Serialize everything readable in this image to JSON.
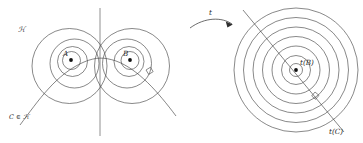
{
  "figure": {
    "colors": {
      "stroke": "#3f3f3f",
      "label": "#2b2b2b",
      "point": "#111111",
      "background": "#ffffff"
    }
  },
  "labels": {
    "family_script_a": "ℋ",
    "point_a": "A",
    "point_b": "B",
    "curve_c": "C ∈ ℋ",
    "map_t": "t",
    "image_point_b": "t(B)",
    "image_curve_c": "t(C)"
  },
  "left_panel": {
    "name": "source-plane",
    "axis": {
      "type": "vertical-line",
      "x": 100,
      "y1": 8,
      "y2": 136
    },
    "point_a": {
      "cx": 71,
      "cy": 60,
      "r": 1.9
    },
    "point_b": {
      "cx": 130,
      "cy": 60,
      "r": 1.9
    },
    "circles_a": [
      {
        "cx": 69.5,
        "cy": 66,
        "r": 37.5
      },
      {
        "cx": 74.5,
        "cy": 63.5,
        "r": 24.5
      },
      {
        "cx": 72.5,
        "cy": 61.5,
        "r": 15.0
      },
      {
        "cx": 71.5,
        "cy": 60.5,
        "r": 9.0
      }
    ],
    "circles_b": [
      {
        "cx": 132.0,
        "cy": 66,
        "r": 37.5
      },
      {
        "cx": 127.0,
        "cy": 63.5,
        "r": 24.5
      },
      {
        "cx": 129.0,
        "cy": 61.5,
        "r": 15.0
      },
      {
        "cx": 130.0,
        "cy": 60.5,
        "r": 9.0
      }
    ],
    "curve_c_path": "M 20 125 C 38 101, 56 74, 84 62 C 96 57, 104 57, 116 61 C 138 69, 158 92, 176 116",
    "right_angle_marker": {
      "x": 146,
      "y": 70,
      "size": 5.2,
      "rotate": -32
    }
  },
  "arrow": {
    "name": "transformation-arrow",
    "path": "M 190 28 C 205 17, 222 17, 232 24",
    "head": "M 232 24 L 226.5 22.0 L 228.0 27.4 Z",
    "label_x": 211,
    "label_y": 15
  },
  "right_panel": {
    "name": "image-plane",
    "center": {
      "cx": 296,
      "cy": 70,
      "r": 1.9
    },
    "concentric_circles": [
      {
        "r": 62.0
      },
      {
        "r": 52.5
      },
      {
        "r": 43.0
      },
      {
        "r": 33.5
      },
      {
        "r": 24.0
      },
      {
        "r": 14.5
      },
      {
        "r": 6.5
      }
    ],
    "line_t_c": {
      "x1": 243,
      "y1": 10,
      "x2": 344,
      "y2": 132
    },
    "right_angle_marker": {
      "x": 315,
      "y": 92,
      "size": 5.2,
      "rotate": 40
    },
    "label_tb": {
      "x": 300,
      "y": 64
    },
    "label_tc": {
      "x": 332,
      "y": 132
    }
  }
}
